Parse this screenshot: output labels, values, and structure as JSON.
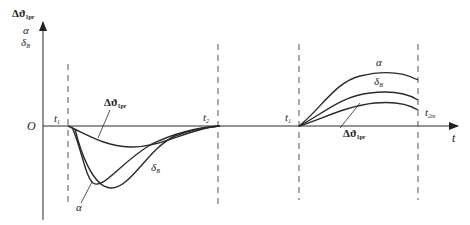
{
  "diagram": {
    "y_axis": {
      "labels": [
        {
          "symbol": "Δϑ",
          "sub": "1pr"
        },
        {
          "symbol": "α",
          "sub": ""
        },
        {
          "symbol": "δ",
          "sub": "B"
        }
      ]
    },
    "x_axis": {
      "label": "t"
    },
    "origin": "O",
    "time_marks": [
      {
        "symbol": "t",
        "sub": "1"
      },
      {
        "symbol": "t",
        "sub": "2"
      },
      {
        "symbol": "t",
        "sub": "1"
      },
      {
        "symbol": "t",
        "sub": "2m"
      }
    ],
    "left_phase": {
      "curves": [
        {
          "symbol": "Δϑ",
          "sub": "1pr"
        },
        {
          "symbol": "α",
          "sub": ""
        },
        {
          "symbol": "δ",
          "sub": "B"
        }
      ]
    },
    "right_phase": {
      "curves": [
        {
          "symbol": "α",
          "sub": ""
        },
        {
          "symbol": "δ",
          "sub": "B"
        },
        {
          "symbol": "Δϑ",
          "sub": "1pr"
        }
      ]
    },
    "colors": {
      "line": "#2a2a2a",
      "dash": "#555555",
      "background": "#ffffff"
    }
  }
}
